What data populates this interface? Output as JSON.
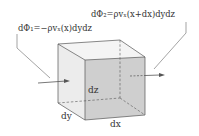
{
  "diagram": {
    "labels": {
      "flux_in": "dΦ₁=−ρvₓ(x)dydz",
      "flux_out": "dΦ₂=ρvₓ(x+dx)dydz",
      "dz": "dz",
      "dy": "dy",
      "dx": "dx"
    },
    "colors": {
      "front_face": "#cfcfcf",
      "side_face": "#e9e9e9",
      "top_face": "#f4f4f4",
      "lines": "#555555",
      "text": "#333333"
    }
  }
}
